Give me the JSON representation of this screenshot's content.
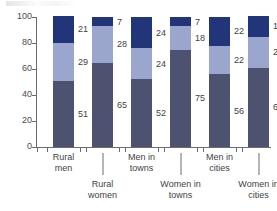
{
  "chart_data": {
    "type": "bar",
    "stacked": true,
    "title": "",
    "subtitle": "",
    "xlabel": "",
    "ylabel": "",
    "ylim": [
      0,
      100
    ],
    "yticks": [
      0,
      20,
      40,
      60,
      80,
      100
    ],
    "grid": false,
    "legend_position": "none",
    "categories": [
      "Rural men",
      "Rural women",
      "Men in towns",
      "Women in towns",
      "Men in cities",
      "Women in cities"
    ],
    "category_lines": [
      [
        "Rural",
        "men"
      ],
      [
        "Rural",
        "women"
      ],
      [
        "Men in",
        "towns"
      ],
      [
        "Women in",
        "towns"
      ],
      [
        "Men in",
        "cities"
      ],
      [
        "Women in",
        "cities"
      ]
    ],
    "series": [
      {
        "name": "bottom",
        "color": "#4d5270",
        "values": [
          51,
          65,
          52,
          75,
          56,
          61
        ]
      },
      {
        "name": "middle",
        "color": "#9aa6ce",
        "values": [
          29,
          28,
          24,
          18,
          22,
          24
        ]
      },
      {
        "name": "top",
        "color": "#22357a",
        "values": [
          21,
          7,
          24,
          7,
          22,
          16
        ]
      }
    ]
  },
  "axis": {
    "y_tick_labels": [
      "0",
      "20",
      "40",
      "60",
      "80",
      "100"
    ]
  },
  "colors": {
    "segment_bottom": "#4d5270",
    "segment_middle": "#9aa6ce",
    "segment_top": "#22357a",
    "axis": "#6c6c6c",
    "text": "#3f3f3f",
    "background": "#ffffff"
  }
}
